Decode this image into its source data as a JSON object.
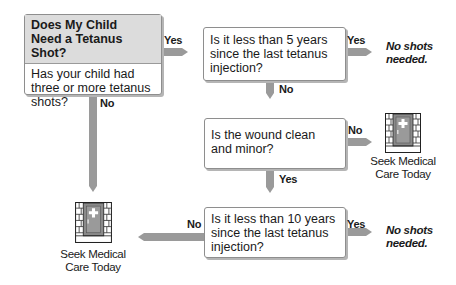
{
  "title": "Does My Child Need a Tetanus Shot?",
  "nodes": {
    "start": {
      "header": "Does My Child Need a Tetanus Shot?",
      "header_line1": "Does My Child",
      "header_line2": "Need a Tetanus Shot?",
      "question_line1": "Has your child had",
      "question_line2": "three or more tetanus",
      "question_line3": "shots?"
    },
    "q_five_years": {
      "line1": "Is it less than 5 years",
      "line2": "since the last tetanus",
      "line3": "injection?"
    },
    "q_wound": {
      "line1": "Is the wound clean",
      "line2": "and minor?"
    },
    "q_ten_years": {
      "line1": "Is it less than 10 years",
      "line2": "since the last tetanus",
      "line3": "injection?"
    }
  },
  "outcomes": {
    "no_shots_1": {
      "line1": "No shots",
      "line2": "needed."
    },
    "no_shots_2": {
      "line1": "No shots",
      "line2": "needed."
    },
    "seek_care_1": {
      "line1": "Seek Medical",
      "line2": "Care Today",
      "icon": "clinic-door-icon"
    },
    "seek_care_2": {
      "line1": "Seek Medical",
      "line2": "Care Today",
      "icon": "clinic-door-icon"
    }
  },
  "edges": {
    "start_yes": "Yes",
    "start_no": "No",
    "five_yes": "Yes",
    "five_no": "No",
    "wound_no": "No",
    "wound_yes": "Yes",
    "ten_no": "No",
    "ten_yes": "Yes"
  },
  "colors": {
    "arrow": "#999999",
    "header_bg": "#dcdcdc",
    "door": "#8a8a8a",
    "brick": "#d9d9d9"
  }
}
